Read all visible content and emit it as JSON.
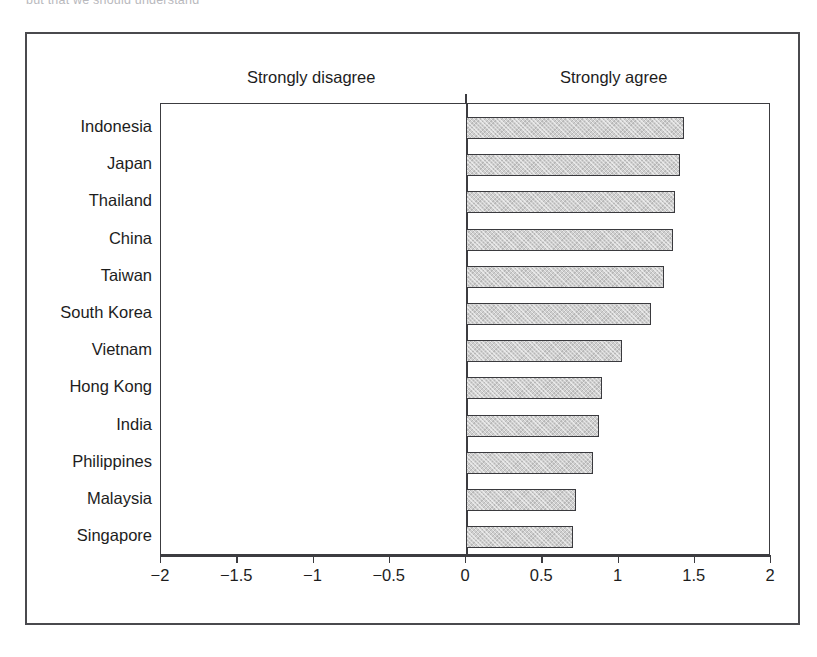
{
  "top_caption": "but that we should understand",
  "headings": {
    "left": "Strongly disagree",
    "right": "Strongly agree"
  },
  "colors": {
    "bar_fill": "#cfcfcf",
    "bar_border": "#3a3a3e",
    "frame": "#4a4a4e",
    "text": "#1d1d1d"
  },
  "chart_data": {
    "type": "bar",
    "orientation": "horizontal",
    "title": "",
    "subtitle": "",
    "xlabel": "",
    "ylabel": "",
    "xlim": [
      -2,
      2
    ],
    "xticks": [
      -2,
      -1.5,
      -1,
      -0.5,
      0,
      0.5,
      1,
      1.5,
      2
    ],
    "xtick_labels": [
      "−2",
      "−1.5",
      "−1",
      "−0.5",
      "0",
      "0.5",
      "1",
      "1.5",
      "2"
    ],
    "grid": false,
    "legend": null,
    "annotations": [
      "Strongly disagree",
      "Strongly agree"
    ],
    "categories": [
      "Indonesia",
      "Japan",
      "Thailand",
      "China",
      "Taiwan",
      "South Korea",
      "Vietnam",
      "Hong Kong",
      "India",
      "Philippines",
      "Malaysia",
      "Singapore"
    ],
    "values": [
      1.43,
      1.4,
      1.37,
      1.36,
      1.3,
      1.21,
      1.02,
      0.89,
      0.87,
      0.83,
      0.72,
      0.7
    ]
  }
}
